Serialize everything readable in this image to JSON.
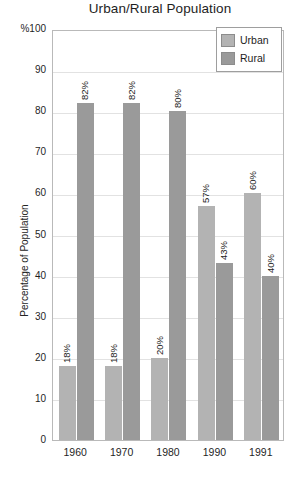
{
  "chart_data": {
    "type": "bar",
    "title": "Urban/Rural Population",
    "xlabel": "",
    "ylabel": "Percentage of Population",
    "ylim": [
      0,
      100
    ],
    "yticks": [
      100,
      90,
      80,
      70,
      60,
      50,
      40,
      30,
      20,
      10,
      0
    ],
    "ytick_labels": [
      "%100",
      "90",
      "80",
      "70",
      "60",
      "50",
      "40",
      "30",
      "20",
      "10",
      "0"
    ],
    "grid": true,
    "legend_position": "top-right",
    "categories": [
      "1960",
      "1970",
      "1980",
      "1990",
      "1991"
    ],
    "series": [
      {
        "name": "Urban",
        "color": "#b3b3b3",
        "values": [
          18,
          18,
          20,
          57,
          60
        ],
        "data_labels": [
          "18%",
          "18%",
          "20%",
          "57%",
          "60%"
        ]
      },
      {
        "name": "Rural",
        "color": "#9a9a9a",
        "values": [
          82,
          82,
          80,
          43,
          40
        ],
        "data_labels": [
          "82%",
          "82%",
          "80%",
          "43%",
          "40%"
        ]
      }
    ]
  },
  "legend": {
    "items": [
      {
        "label": "Urban",
        "color": "#b3b3b3"
      },
      {
        "label": "Rural",
        "color": "#9a9a9a"
      }
    ]
  },
  "colors": {
    "urban": "#b3b3b3",
    "rural": "#9a9a9a",
    "plot_border": "#b9b9b9",
    "gridline": "#e2e2e2",
    "text": "#1f1f1f",
    "background": "#ffffff"
  }
}
